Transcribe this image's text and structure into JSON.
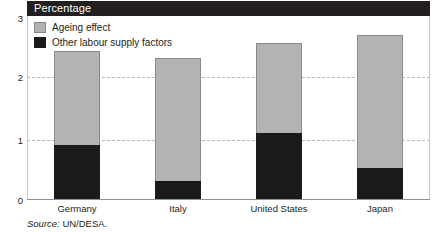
{
  "header": {
    "title": "Percentage"
  },
  "legend": {
    "position": "top-left",
    "items": [
      {
        "label": "Ageing effect",
        "color": "#b3b3b3",
        "swatch": "ageing"
      },
      {
        "label": "Other labour supply factors",
        "color": "#1a1a1a",
        "swatch": "other"
      }
    ]
  },
  "source": {
    "prefix": "Source:",
    "text": " UN/DESA."
  },
  "colors": {
    "ageing": "#b3b3b3",
    "other": "#1a1a1a",
    "title_bar": "#231f20",
    "gridline": "#b9b9b9",
    "axis": "#929292",
    "text": "#231f20"
  },
  "chart_data": {
    "type": "bar",
    "stacked": true,
    "title": "Percentage",
    "xlabel": "",
    "ylabel": "Percentage",
    "ylim": [
      0,
      3
    ],
    "yticks": [
      0,
      1,
      2,
      3
    ],
    "ytick_labels": [
      "0",
      "1",
      "2",
      "3"
    ],
    "grid": true,
    "grid_axis": "y",
    "legend_position": "top-left",
    "categories": [
      "Germany",
      "Italy",
      "United States",
      "Japan"
    ],
    "series": [
      {
        "name": "Other labour supply factors",
        "color": "#1a1a1a",
        "values": [
          0.82,
          0.28,
          1.0,
          0.47
        ]
      },
      {
        "name": "Ageing effect",
        "color": "#b3b3b3",
        "values": [
          1.43,
          1.85,
          1.37,
          2.01
        ]
      }
    ],
    "totals": [
      2.25,
      2.13,
      2.37,
      2.48
    ],
    "source": "Source: UN/DESA."
  }
}
